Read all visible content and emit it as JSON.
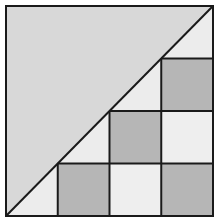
{
  "figure": {
    "grid_divisions": 4,
    "colors": {
      "upper_triangle": "#d8d8d8",
      "dark_cell": "#b6b6b6",
      "light_cell": "#eeeeee",
      "half_cell": "#ececec",
      "line": "#1a1a1a",
      "background": "#ffffff"
    },
    "dark_cells": [
      [
        1,
        3
      ],
      [
        2,
        2
      ],
      [
        3,
        1
      ],
      [
        3,
        3
      ]
    ],
    "light_cells": [
      [
        2,
        3
      ],
      [
        3,
        2
      ]
    ],
    "half_cells": [
      [
        0,
        3
      ],
      [
        1,
        2
      ],
      [
        2,
        1
      ],
      [
        3,
        0
      ]
    ]
  }
}
